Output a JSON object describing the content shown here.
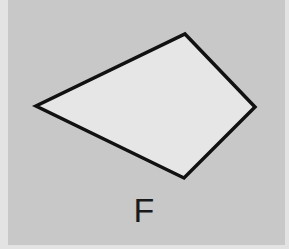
{
  "figure": {
    "label": "F",
    "shape": "quadrilateral",
    "vertices": [
      [
        185,
        34
      ],
      [
        255,
        107
      ],
      [
        184,
        178
      ],
      [
        36,
        106
      ]
    ],
    "colors": {
      "background": "#c8c8c8",
      "border_strip": "#e3e3e3",
      "shape_fill": "#e6e6e6",
      "outline": "#111111"
    }
  }
}
